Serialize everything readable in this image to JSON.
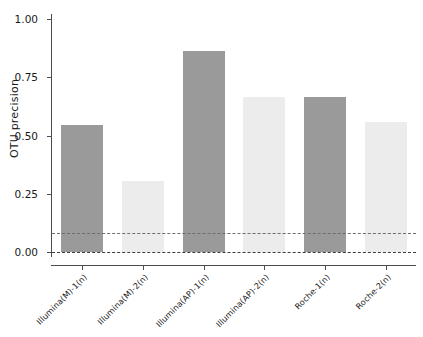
{
  "chart_data": {
    "type": "bar",
    "title": "",
    "subtitle": "",
    "xlabel": "",
    "ylabel": "OTU precision",
    "ylim": [
      0.0,
      1.0
    ],
    "ytick_labels": [
      "0.00",
      "0.25",
      "0.50",
      "0.75",
      "1.00"
    ],
    "ytick_values": [
      0.0,
      0.25,
      0.5,
      0.75,
      1.0
    ],
    "grid": false,
    "legend": "none",
    "categories": [
      "Illumina(M)-1(n)",
      "Illumina(M)-2(n)",
      "Illumina(AP)-1(n)",
      "Illumina(AP)-2(n)",
      "Roche-1(n)",
      "Roche-2(n)"
    ],
    "values": [
      0.545,
      0.305,
      0.863,
      0.667,
      0.667,
      0.558
    ],
    "bar_colors": [
      "#9a9a9a",
      "#ececec",
      "#9a9a9a",
      "#ececec",
      "#9a9a9a",
      "#ececec"
    ],
    "reference_lines": [
      {
        "name": "upper-threshold",
        "value": 0.08,
        "style": "dashed",
        "color": "#6e6e6e"
      },
      {
        "name": "baseline-zero",
        "value": 0.0,
        "style": "dashed",
        "color": "#3c3c3c"
      }
    ],
    "axis_color": "#4d4d4d",
    "background": "#ffffff"
  }
}
